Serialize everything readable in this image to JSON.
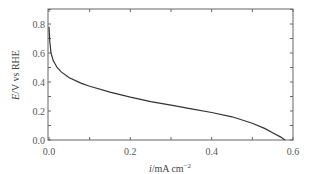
{
  "chart_data": {
    "type": "line",
    "title": "",
    "xlabel": "i/mA cm−2",
    "xlabel_parts": {
      "italic": "i",
      "rest": "/mA cm",
      "sup": "−2"
    },
    "ylabel": "E/V vs RHE",
    "ylabel_parts": {
      "italic": "E",
      "rest": "/V vs RHE"
    },
    "xlim": [
      0.0,
      0.6
    ],
    "ylim": [
      0.0,
      0.9
    ],
    "xticks": [
      "0.0",
      "0.2",
      "0.4",
      "0.6"
    ],
    "yticks": [
      "0.0",
      "0.2",
      "0.4",
      "0.6",
      "0.8"
    ],
    "grid": false,
    "legend": null,
    "series": [
      {
        "name": "polarization curve",
        "color": "#333333",
        "x": [
          0.0,
          0.002,
          0.005,
          0.01,
          0.02,
          0.03,
          0.05,
          0.08,
          0.1,
          0.15,
          0.2,
          0.25,
          0.3,
          0.35,
          0.4,
          0.45,
          0.5,
          0.53,
          0.55,
          0.57,
          0.58
        ],
        "y": [
          0.78,
          0.68,
          0.6,
          0.55,
          0.5,
          0.47,
          0.43,
          0.39,
          0.37,
          0.33,
          0.295,
          0.265,
          0.24,
          0.215,
          0.19,
          0.16,
          0.115,
          0.08,
          0.05,
          0.02,
          0.0
        ]
      }
    ]
  }
}
